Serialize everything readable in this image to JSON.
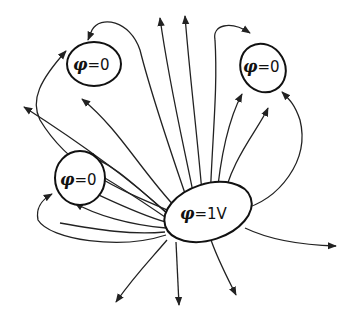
{
  "diagram": {
    "title": "",
    "conductors": [
      {
        "id": "top-left",
        "symbol": "φ",
        "equals": "=",
        "value": "0"
      },
      {
        "id": "top-right",
        "symbol": "φ",
        "equals": "=",
        "value": "0"
      },
      {
        "id": "left",
        "symbol": "φ",
        "equals": "=",
        "value": "0"
      },
      {
        "id": "source",
        "symbol": "φ",
        "equals": "=",
        "value": "1V"
      }
    ],
    "colors": {
      "line": "#222222",
      "background": "#ffffff"
    }
  }
}
